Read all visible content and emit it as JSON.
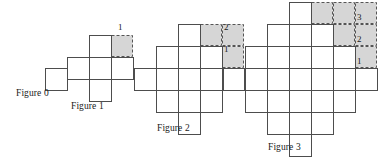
{
  "diagram": {
    "cell": 22,
    "stroke": "#4d4d4d",
    "stroke_width": 1,
    "shade_fill": "#d6d6d6",
    "shade_stroke": "#555555",
    "background": "#ffffff",
    "figures": [
      {
        "id": "figure-0",
        "caption": "Figure 0",
        "n": 0,
        "cell_count": 1,
        "origin": {
          "x": 45,
          "y": 68
        },
        "caption_pos": {
          "x": 16,
          "y": 88
        },
        "cells": [
          [
            0,
            0
          ]
        ],
        "shaded": [],
        "labels": []
      },
      {
        "id": "figure-1",
        "caption": "Figure 1",
        "n": 1,
        "cell_count": 5,
        "origin": {
          "x": 89,
          "y": 57
        },
        "caption_pos": {
          "x": 71,
          "y": 101
        },
        "cells": [
          [
            0,
            0
          ],
          [
            -1,
            0
          ],
          [
            1,
            0
          ],
          [
            0,
            -1
          ],
          [
            0,
            1
          ]
        ],
        "shaded": [
          [
            1,
            -1
          ]
        ],
        "labels": [
          {
            "text": "1",
            "x": 118,
            "y": 22
          }
        ]
      },
      {
        "id": "figure-2",
        "caption": "Figure 2",
        "n": 2,
        "cell_count": 13,
        "origin": {
          "x": 178,
          "y": 68
        },
        "caption_pos": {
          "x": 157,
          "y": 123
        },
        "cells": [
          [
            0,
            0
          ],
          [
            -1,
            0
          ],
          [
            1,
            0
          ],
          [
            -2,
            0
          ],
          [
            2,
            0
          ],
          [
            0,
            -1
          ],
          [
            -1,
            -1
          ],
          [
            1,
            -1
          ],
          [
            0,
            1
          ],
          [
            -1,
            1
          ],
          [
            1,
            1
          ],
          [
            0,
            -2
          ],
          [
            0,
            2
          ]
        ],
        "shaded": [
          [
            1,
            -2
          ],
          [
            2,
            -2
          ],
          [
            2,
            -1
          ]
        ],
        "labels": [
          {
            "text": "2",
            "x": 224,
            "y": 22
          },
          {
            "text": "1",
            "x": 224,
            "y": 44
          }
        ]
      },
      {
        "id": "figure-3",
        "caption": "Figure 3",
        "n": 3,
        "cell_count": 25,
        "origin": {
          "x": 289,
          "y": 68
        },
        "caption_pos": {
          "x": 268,
          "y": 142
        },
        "cells": [
          [
            0,
            0
          ],
          [
            -1,
            0
          ],
          [
            1,
            0
          ],
          [
            -2,
            0
          ],
          [
            2,
            0
          ],
          [
            -3,
            0
          ],
          [
            3,
            0
          ],
          [
            0,
            -1
          ],
          [
            -1,
            -1
          ],
          [
            1,
            -1
          ],
          [
            -2,
            -1
          ],
          [
            2,
            -1
          ],
          [
            0,
            1
          ],
          [
            -1,
            1
          ],
          [
            1,
            1
          ],
          [
            -2,
            1
          ],
          [
            2,
            1
          ],
          [
            0,
            -2
          ],
          [
            -1,
            -2
          ],
          [
            1,
            -2
          ],
          [
            0,
            2
          ],
          [
            -1,
            2
          ],
          [
            1,
            2
          ],
          [
            0,
            -3
          ],
          [
            0,
            3
          ]
        ],
        "shaded": [
          [
            1,
            -3
          ],
          [
            2,
            -3
          ],
          [
            3,
            -3
          ],
          [
            2,
            -2
          ],
          [
            3,
            -2
          ],
          [
            3,
            -1
          ]
        ],
        "labels": [
          {
            "text": "3",
            "x": 357,
            "y": 12
          },
          {
            "text": "2",
            "x": 357,
            "y": 34
          },
          {
            "text": "1",
            "x": 357,
            "y": 56
          }
        ]
      }
    ]
  },
  "chart_data": {
    "type": "diagram",
    "categories": [
      "Figure 0",
      "Figure 1",
      "Figure 2",
      "Figure 3"
    ],
    "values": [
      1,
      5,
      13,
      25
    ],
    "series": [
      {
        "name": "total squares",
        "values": [
          1,
          5,
          13,
          25
        ]
      },
      {
        "name": "shaded staircase squares",
        "values": [
          0,
          1,
          3,
          6
        ]
      },
      {
        "name": "staircase step labels",
        "values": [
          0,
          1,
          2,
          3
        ]
      }
    ],
    "xlabel": "Figure number",
    "ylabel": "Number of unit squares",
    "grid": true,
    "legend": "none"
  }
}
